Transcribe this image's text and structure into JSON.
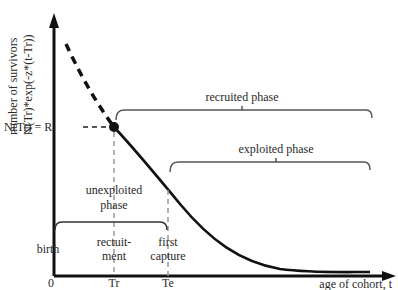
{
  "diagram": {
    "y_axis": {
      "label_line1": "number of survivors",
      "label_line2": "N(Tr)*exp(-z*(t-Tr))"
    },
    "x_axis": {
      "label": "age of cohort, t",
      "ticks": [
        "0",
        "Tr",
        "Te"
      ]
    },
    "point_label": "N(Tr) = R",
    "braces": {
      "recruited": "recruited phase",
      "exploited": "exploited phase",
      "unexploited_line1": "unexploited",
      "unexploited_line2": "phase"
    },
    "events": {
      "birth": "birth",
      "recruitment_line1": "rectuit-",
      "recruitment_line2": "ment",
      "capture_line1": "first",
      "capture_line2": "capture"
    },
    "colors": {
      "line": "#111111",
      "dashed_guide": "#999999",
      "brace": "#555555",
      "text": "#2a2a2a"
    }
  }
}
